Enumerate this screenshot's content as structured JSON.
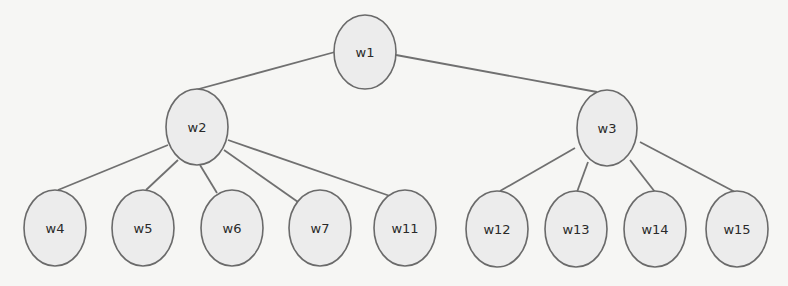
{
  "diagram": {
    "type": "tree",
    "colors": {
      "background": "#f6f6f4",
      "node_fill": "#ececec",
      "node_stroke": "#6a6a6a",
      "edge": "#707070",
      "text": "#2a2a2a"
    },
    "nodes": [
      {
        "id": "w1",
        "label": "w1",
        "cx": 365,
        "cy": 52,
        "rx": 31,
        "ry": 37
      },
      {
        "id": "w2",
        "label": "w2",
        "cx": 197,
        "cy": 127,
        "rx": 31,
        "ry": 38
      },
      {
        "id": "w3",
        "label": "w3",
        "cx": 607,
        "cy": 128,
        "rx": 30,
        "ry": 38
      },
      {
        "id": "w4",
        "label": "w4",
        "cx": 55,
        "cy": 228,
        "rx": 31,
        "ry": 38
      },
      {
        "id": "w5",
        "label": "w5",
        "cx": 143,
        "cy": 228,
        "rx": 31,
        "ry": 38
      },
      {
        "id": "w6",
        "label": "w6",
        "cx": 232,
        "cy": 228,
        "rx": 31,
        "ry": 38
      },
      {
        "id": "w7",
        "label": "w7",
        "cx": 320,
        "cy": 228,
        "rx": 31,
        "ry": 38
      },
      {
        "id": "w11",
        "label": "w11",
        "cx": 405,
        "cy": 228,
        "rx": 31,
        "ry": 38
      },
      {
        "id": "w12",
        "label": "w12",
        "cx": 497,
        "cy": 229,
        "rx": 31,
        "ry": 38
      },
      {
        "id": "w13",
        "label": "w13",
        "cx": 576,
        "cy": 229,
        "rx": 31,
        "ry": 38
      },
      {
        "id": "w14",
        "label": "w14",
        "cx": 655,
        "cy": 229,
        "rx": 31,
        "ry": 38
      },
      {
        "id": "w15",
        "label": "w15",
        "cx": 737,
        "cy": 229,
        "rx": 31,
        "ry": 38
      }
    ],
    "edges": [
      {
        "from": "w1",
        "to": "w2",
        "x1": 335,
        "y1": 52,
        "x2": 195,
        "y2": 90
      },
      {
        "from": "w1",
        "to": "w3",
        "x1": 396,
        "y1": 55,
        "x2": 597,
        "y2": 92
      },
      {
        "from": "w2",
        "to": "w4",
        "x1": 168,
        "y1": 145,
        "x2": 58,
        "y2": 190
      },
      {
        "from": "w2",
        "to": "w5",
        "x1": 178,
        "y1": 160,
        "x2": 146,
        "y2": 190
      },
      {
        "from": "w2",
        "to": "w6",
        "x1": 200,
        "y1": 165,
        "x2": 217,
        "y2": 193
      },
      {
        "from": "w2",
        "to": "w7",
        "x1": 224,
        "y1": 150,
        "x2": 298,
        "y2": 202
      },
      {
        "from": "w2",
        "to": "w11",
        "x1": 228,
        "y1": 140,
        "x2": 390,
        "y2": 196
      },
      {
        "from": "w3",
        "to": "w12",
        "x1": 575,
        "y1": 148,
        "x2": 500,
        "y2": 191
      },
      {
        "from": "w3",
        "to": "w13",
        "x1": 588,
        "y1": 162,
        "x2": 577,
        "y2": 192
      },
      {
        "from": "w3",
        "to": "w14",
        "x1": 630,
        "y1": 160,
        "x2": 655,
        "y2": 192
      },
      {
        "from": "w3",
        "to": "w15",
        "x1": 640,
        "y1": 142,
        "x2": 735,
        "y2": 192
      }
    ]
  }
}
